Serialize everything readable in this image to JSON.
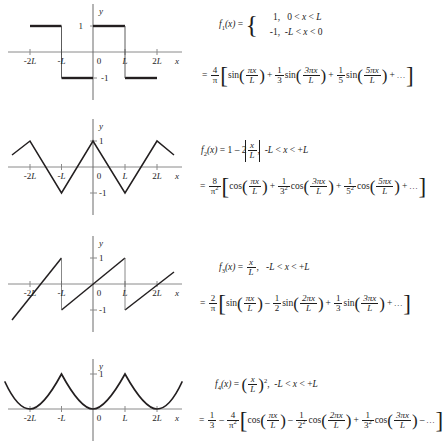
{
  "figure": {
    "axis": {
      "x_label": "x",
      "y_label": "y",
      "x_ticks": [
        "-2L",
        "-L",
        "0",
        "L",
        "2L"
      ],
      "y_ticks_pos": "1",
      "y_ticks_neg": "-1"
    },
    "colors": {
      "curve": "#231f20",
      "axis": "#808080",
      "text": "#1d1d1d"
    }
  },
  "rows": [
    {
      "name": "square-wave",
      "chart": {
        "type": "line",
        "title": "Square wave f1(x)",
        "xlabel": "x",
        "ylabel": "y",
        "xlim": [
          -2.6,
          2.6
        ],
        "ylim": [
          -1.5,
          1.5
        ],
        "x_ticks": [
          -2,
          -1,
          0,
          1,
          2
        ],
        "x_ticklabels": [
          "-2L",
          "-L",
          "0",
          "L",
          "2L"
        ],
        "y_ticks": [
          -1,
          1
        ],
        "y_ticklabels": [
          "-1",
          "1"
        ],
        "grid": false,
        "description": "Odd square wave of period 2L, value +1 on (0,L) and -1 on (-L,0), repeated",
        "segments": [
          {
            "x": [
              -2.6,
              -2.0
            ],
            "y": [
              -1,
              -1
            ]
          },
          {
            "x": [
              -2.0,
              -1.0
            ],
            "y": [
              1,
              1
            ]
          },
          {
            "x": [
              -1.0,
              0.0
            ],
            "y": [
              -1,
              -1
            ]
          },
          {
            "x": [
              0.0,
              1.0
            ],
            "y": [
              1,
              1
            ]
          },
          {
            "x": [
              1.0,
              2.0
            ],
            "y": [
              -1,
              -1
            ]
          },
          {
            "x": [
              2.0,
              2.6
            ],
            "y": [
              1,
              1
            ]
          }
        ]
      },
      "def": {
        "fname": "f",
        "fsub": "1",
        "arg": "(x) =",
        "case1_val": "1,",
        "case1_dom": "0 < x < L",
        "case2_val": "-1,",
        "case2_dom": "-L < x < 0"
      },
      "series": {
        "eq": "=",
        "pref_num": "4",
        "pref_den": "π",
        "terms": [
          {
            "sign": "",
            "coef_num": "",
            "coef_den": "",
            "fn": "sin",
            "arg_num": "πx",
            "arg_den": "L"
          },
          {
            "sign": "+",
            "coef_num": "1",
            "coef_den": "3",
            "fn": "sin",
            "arg_num": "3πx",
            "arg_den": "L"
          },
          {
            "sign": "+",
            "coef_num": "1",
            "coef_den": "5",
            "fn": "sin",
            "arg_num": "5πx",
            "arg_den": "L"
          }
        ],
        "tail": "+ ..."
      }
    },
    {
      "name": "triangle-wave",
      "chart": {
        "type": "line",
        "title": "Triangle wave f2(x)",
        "xlabel": "x",
        "ylabel": "y",
        "xlim": [
          -2.6,
          2.6
        ],
        "ylim": [
          -1.5,
          1.5
        ],
        "x_ticks": [
          -2,
          -1,
          0,
          1,
          2
        ],
        "x_ticklabels": [
          "-2L",
          "-L",
          "0",
          "L",
          "2L"
        ],
        "y_ticks": [
          -1,
          1
        ],
        "y_ticklabels": [
          "-1",
          "1"
        ],
        "grid": false,
        "description": "Even triangular wave, peaks +1 at x = 0 and x = ±2L, troughs -1 at x = ±L",
        "x": [
          -2.6,
          -2.0,
          -1.0,
          0.0,
          1.0,
          2.0,
          2.6
        ],
        "y": [
          0.2,
          1,
          -1,
          1,
          -1,
          1,
          0.2
        ]
      },
      "def": {
        "fname": "f",
        "fsub": "2",
        "arg": "(x) = 1 - 2",
        "absnum": "x",
        "absden": "L",
        "comma": ",",
        "domain": "-L < x < +L"
      },
      "series": {
        "eq": "=",
        "pref_num": "8",
        "pref_den": "π²",
        "terms": [
          {
            "sign": "",
            "coef_num": "",
            "coef_den": "",
            "fn": "cos",
            "arg_num": "πx",
            "arg_den": "L"
          },
          {
            "sign": "+",
            "coef_num": "1",
            "coef_den": "3²",
            "fn": "cos",
            "arg_num": "3πx",
            "arg_den": "L"
          },
          {
            "sign": "+",
            "coef_num": "1",
            "coef_den": "5²",
            "fn": "cos",
            "arg_num": "5πx",
            "arg_den": "L"
          }
        ],
        "tail": "+ ..."
      }
    },
    {
      "name": "sawtooth-wave",
      "chart": {
        "type": "line",
        "title": "Sawtooth wave f3(x)",
        "xlabel": "x",
        "ylabel": "y",
        "xlim": [
          -2.6,
          2.6
        ],
        "ylim": [
          -1.5,
          1.5
        ],
        "x_ticks": [
          -2,
          -1,
          0,
          1,
          2
        ],
        "x_ticklabels": [
          "-2L",
          "-L",
          "0",
          "L",
          "2L"
        ],
        "y_ticks": [
          -1,
          1
        ],
        "y_ticklabels": [
          "-1",
          "1"
        ],
        "grid": false,
        "description": "Odd sawtooth f = x/L on (-L,L) repeated with period 2L; jumps at x = ±L",
        "segments": [
          {
            "x": [
              -2.6,
              -1.0
            ],
            "y": [
              -0.6,
              1
            ]
          },
          {
            "x": [
              -1.0,
              1.0
            ],
            "y": [
              -1,
              1
            ]
          },
          {
            "x": [
              1.0,
              2.6
            ],
            "y": [
              -1,
              0.6
            ]
          }
        ]
      },
      "def": {
        "fname": "f",
        "fsub": "3",
        "arg": "(x) =",
        "fnum": "x",
        "fden": "L",
        "comma": ",",
        "domain": "-L < x < +L"
      },
      "series": {
        "eq": "=",
        "pref_num": "2",
        "pref_den": "π",
        "terms": [
          {
            "sign": "",
            "coef_num": "",
            "coef_den": "",
            "fn": "sin",
            "arg_num": "πx",
            "arg_den": "L"
          },
          {
            "sign": "–",
            "coef_num": "1",
            "coef_den": "2",
            "fn": "sin",
            "arg_num": "2πx",
            "arg_den": "L"
          },
          {
            "sign": "+",
            "coef_num": "1",
            "coef_den": "3",
            "fn": "sin",
            "arg_num": "3πx",
            "arg_den": "L"
          }
        ],
        "tail": "+ ..."
      }
    },
    {
      "name": "parabolic-wave",
      "chart": {
        "type": "line",
        "title": "Parabolic wave f4(x)",
        "xlabel": "x",
        "ylabel": "y",
        "xlim": [
          -2.75,
          2.75
        ],
        "ylim": [
          -0.4,
          1.35
        ],
        "x_ticks": [
          -2,
          -1,
          0,
          1,
          2
        ],
        "x_ticklabels": [
          "-2L",
          "-L",
          "0",
          "L",
          "2L"
        ],
        "y_ticks": [
          1
        ],
        "y_ticklabels": [
          "1"
        ],
        "grid": false,
        "description": "Even parabolic wave f = (x/L)^2 on (-L,L) repeated; minima 0 at x = 0, ±2L; cusps +1 at x = ±L",
        "period": 2,
        "formula": "((x mod 2L) centered)^2 / L^2"
      },
      "def": {
        "fname": "f",
        "fsub": "4",
        "arg": "(x) =",
        "fnum": "x",
        "fden": "L",
        "exp": "2",
        "comma": ",",
        "domain": "-L < x < +L"
      },
      "series": {
        "eq": "=",
        "lead_num": "1",
        "lead_den": "3",
        "minus": "–",
        "pref_num": "4",
        "pref_den": "π²",
        "terms": [
          {
            "sign": "",
            "coef_num": "",
            "coef_den": "",
            "fn": "cos",
            "arg_num": "πx",
            "arg_den": "L"
          },
          {
            "sign": "–",
            "coef_num": "1",
            "coef_den": "2²",
            "fn": "cos",
            "arg_num": "2πx",
            "arg_den": "L"
          },
          {
            "sign": "+",
            "coef_num": "1",
            "coef_den": "3²",
            "fn": "cos",
            "arg_num": "3πx",
            "arg_den": "L"
          }
        ],
        "tail": "– ..."
      }
    }
  ]
}
